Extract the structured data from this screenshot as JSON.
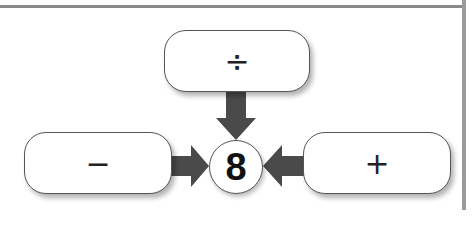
{
  "diagram": {
    "center_value": "8",
    "top_box": {
      "symbol": "÷",
      "name": "divide"
    },
    "left_box": {
      "symbol": "−",
      "name": "minus"
    },
    "right_box": {
      "symbol": "+",
      "name": "plus"
    }
  },
  "colors": {
    "arrow": "#4a4a4a",
    "border": "#555555"
  }
}
